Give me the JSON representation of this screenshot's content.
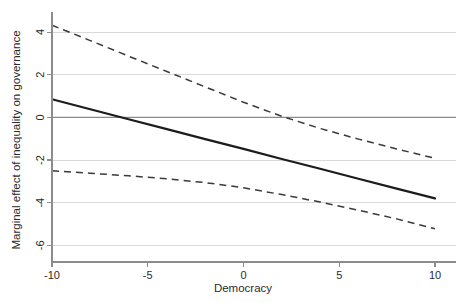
{
  "chart_data": {
    "type": "line",
    "title": "",
    "subtitle": "",
    "xlabel": "Democracy",
    "ylabel": "Marginal effect of inequality on governance",
    "xlim": [
      -10,
      10
    ],
    "ylim": [
      -6.5,
      4.8
    ],
    "xticks": [
      -10,
      -5,
      0,
      5,
      10
    ],
    "xticklabels": [
      "-10",
      "-5",
      "0",
      "5",
      "10"
    ],
    "yticks": [
      4,
      2,
      0,
      -2,
      -4,
      -6
    ],
    "yticklabels": [
      "4",
      "2",
      "0",
      "-2",
      "-4",
      "-6"
    ],
    "grid": "horizontal",
    "legend": "none",
    "annotations": [
      "Solid line: marginal effect point estimate",
      "Dashed lines: 95% confidence interval",
      "Horizontal reference line at zero"
    ],
    "reference_lines": [
      {
        "name": "zero-line",
        "orientation": "horizontal",
        "value": 0
      }
    ],
    "x": [
      -10,
      -8,
      -6,
      -4,
      -2,
      0,
      2,
      4,
      6,
      8,
      10
    ],
    "series": [
      {
        "name": "Marginal effect (point estimate)",
        "style": "solid",
        "color": "#1c1c1c",
        "values": [
          0.85,
          0.38,
          -0.09,
          -0.55,
          -1.02,
          -1.48,
          -1.95,
          -2.41,
          -2.88,
          -3.34,
          -3.8
        ]
      },
      {
        "name": "Upper 95% confidence bound",
        "style": "dashed",
        "color": "#3a3a3a",
        "values": [
          4.32,
          3.6,
          2.87,
          2.15,
          1.43,
          0.71,
          0.05,
          -0.52,
          -1.02,
          -1.48,
          -1.92
        ]
      },
      {
        "name": "Lower 95% confidence bound",
        "style": "dashed",
        "color": "#3a3a3a",
        "values": [
          -2.5,
          -2.62,
          -2.74,
          -2.88,
          -3.06,
          -3.3,
          -3.62,
          -3.97,
          -4.35,
          -4.76,
          -5.22
        ]
      }
    ],
    "crossings": {
      "estimate_crosses_zero_at_x": -6.4,
      "upper_bound_crosses_zero_at_x": 0.6
    }
  },
  "colors": {
    "background": "#ffffff",
    "grid": "#d9d9d9",
    "axis": "#8c8c8c",
    "estimate": "#1c1c1c",
    "confidence": "#3a3a3a",
    "text": "#2b2b2b"
  }
}
